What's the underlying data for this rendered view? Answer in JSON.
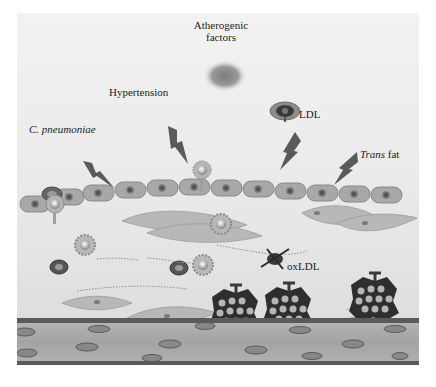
{
  "figure": {
    "title_label": "Atherogenic factors",
    "title_line1": "Atherogenic",
    "title_line2": "factors",
    "factors": [
      {
        "id": "c-pneumoniae",
        "label": "C. pneumoniae",
        "italic": true
      },
      {
        "id": "hypertension",
        "label": "Hypertension",
        "italic": false
      },
      {
        "id": "ldl",
        "label": "LDL",
        "italic": false
      },
      {
        "id": "trans-fat",
        "label_italic": "Trans",
        "label_rest": " fat"
      }
    ],
    "oxldl_label": "oxLDL",
    "colors": {
      "background": "#ebebeb",
      "bolt": "#5a5a5a",
      "endothelial_cell": "#a8a8a8",
      "nucleus": "#555555",
      "foam_cell": "#2e2e2e",
      "lipid_droplet": "#b5b5b5",
      "media_layer": "#a0a0a0"
    }
  }
}
